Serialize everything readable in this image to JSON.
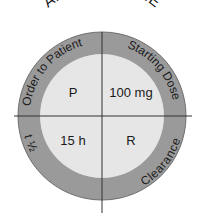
{
  "title": "AMITRIPTYLINE",
  "ring_labels": {
    "top_left": "Order to Patient",
    "top_right": "Starting Dose",
    "bottom_left": "t ½",
    "bottom_right": "Clearance"
  },
  "quadrants": {
    "top_left": "P",
    "top_right": "100 mg",
    "bottom_left": "15 h",
    "bottom_right": "R"
  },
  "colors": {
    "ring": "#9a9a9a",
    "center": "#e6e6e6",
    "line": "#333333",
    "text": "#1a1a1a"
  }
}
